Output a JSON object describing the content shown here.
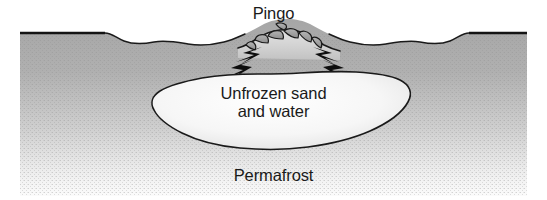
{
  "figure": {
    "kind": "geological-cross-section",
    "width_px": 547,
    "height_px": 200,
    "background_color": "#ffffff"
  },
  "labels": {
    "title": "Pingo",
    "lens_line1": "Unfrozen sand",
    "lens_line2": "and water",
    "ground": "Permafrost"
  },
  "colors": {
    "outline": "#1a1a1a",
    "permafrost_top": "#a8a8a8",
    "permafrost_bottom": "#f2f2f2",
    "lens_fill_center": "#fdfdfd",
    "lens_fill_edge": "#e2e2e2",
    "mound_fill": "#d0d0d0",
    "block_fill": "#9b9b9b",
    "crack_fill": "#111111",
    "text": "#1a1a1a"
  },
  "parts": {
    "surface_left_terrace": "flat high ground from x=20 to x=105",
    "surface_left_undulation": "wavy tundra surface from x=105 to x=238",
    "pingo_mound": "domed ice-cored hill centered at x=287, summit y=36",
    "summit_blocks": "ruptured crater blocks on the pingo summit",
    "dilation_cracks": "radial tension cracks on both mound flanks",
    "unfrozen_lens": "talik of unfrozen sand and water beneath the pingo",
    "surface_right_undulation": "wavy tundra surface from x=330 to x=455",
    "surface_right_terrace": "flat high ground from x=455 to x=527",
    "permafrost_body": "frozen ground filling the section below the surface"
  }
}
